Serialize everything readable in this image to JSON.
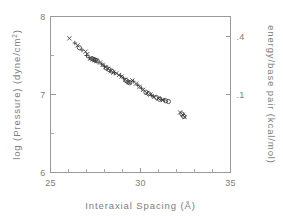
{
  "chart_data": {
    "type": "scatter",
    "title": "",
    "xlabel": "Interaxial Spacing",
    "xlabel_unit": "(Å)",
    "ylabel_left": "log (Pressure) (dyne/cm",
    "ylabel_left_sup": "2",
    "ylabel_left_close": ")",
    "ylabel_right": "energy/base pair (kcal/mol)",
    "xlim": [
      25,
      35
    ],
    "ylim": [
      6,
      8
    ],
    "xticks_major": [
      25,
      30,
      35
    ],
    "xticks_major_labels": [
      "25",
      "30",
      "35"
    ],
    "xticks_minor": [
      26,
      27,
      28,
      29,
      31,
      32,
      33,
      34
    ],
    "yticks_major": [
      6,
      7,
      8
    ],
    "yticks_major_labels": [
      "6",
      "7",
      "8"
    ],
    "yticks_minor": [
      6.5,
      7.5
    ],
    "right_axis_ticks": [
      7.75,
      7.0
    ],
    "right_axis_tick_labels": [
      ".4",
      ".1"
    ],
    "grid": false,
    "legend": "none",
    "axis_color": "#9a9a9a",
    "marker_color": "#3d3d3d",
    "background_color": "#ffffff",
    "series": [
      {
        "name": "cross",
        "marker": "x",
        "points": [
          [
            26.05,
            7.72
          ],
          [
            26.5,
            7.63
          ],
          [
            26.95,
            7.55
          ],
          [
            27.05,
            7.52
          ],
          [
            27.2,
            7.46
          ],
          [
            27.35,
            7.45
          ],
          [
            27.45,
            7.44
          ],
          [
            27.55,
            7.43
          ],
          [
            27.75,
            7.41
          ],
          [
            27.9,
            7.38
          ],
          [
            28.05,
            7.35
          ],
          [
            28.2,
            7.33
          ],
          [
            28.35,
            7.3
          ],
          [
            28.5,
            7.28
          ],
          [
            28.65,
            7.27
          ],
          [
            28.8,
            7.25
          ],
          [
            28.95,
            7.23
          ],
          [
            29.15,
            7.19
          ],
          [
            29.35,
            7.16
          ],
          [
            29.55,
            7.18
          ],
          [
            29.75,
            7.14
          ],
          [
            29.95,
            7.1
          ],
          [
            30.15,
            7.06
          ],
          [
            30.35,
            7.02
          ],
          [
            30.55,
            7.0
          ],
          [
            30.75,
            6.97
          ],
          [
            31.0,
            6.95
          ],
          [
            31.25,
            6.93
          ],
          [
            32.2,
            6.77
          ],
          [
            32.35,
            6.74
          ],
          [
            32.45,
            6.71
          ]
        ]
      },
      {
        "name": "open-circle",
        "marker": "o",
        "points": [
          [
            26.6,
            7.6
          ],
          [
            27.3,
            7.46
          ],
          [
            27.4,
            7.45
          ],
          [
            27.5,
            7.44
          ],
          [
            27.6,
            7.43
          ],
          [
            28.1,
            7.34
          ],
          [
            28.25,
            7.32
          ],
          [
            28.4,
            7.3
          ],
          [
            29.2,
            7.18
          ],
          [
            29.3,
            7.16
          ],
          [
            29.4,
            7.15
          ],
          [
            30.3,
            7.03
          ],
          [
            30.45,
            7.01
          ],
          [
            30.9,
            6.96
          ],
          [
            31.05,
            6.94
          ],
          [
            31.4,
            6.92
          ],
          [
            31.55,
            6.91
          ],
          [
            32.3,
            6.75
          ],
          [
            32.4,
            6.72
          ]
        ]
      },
      {
        "name": "plus",
        "marker": "+",
        "points": [
          [
            26.35,
            7.66
          ],
          [
            26.75,
            7.57
          ],
          [
            27.0,
            7.5
          ],
          [
            27.15,
            7.47
          ],
          [
            27.85,
            7.39
          ],
          [
            28.0,
            7.36
          ],
          [
            28.55,
            7.28
          ],
          [
            28.9,
            7.24
          ],
          [
            29.05,
            7.21
          ],
          [
            29.6,
            7.17
          ],
          [
            29.85,
            7.12
          ],
          [
            30.05,
            7.08
          ],
          [
            30.6,
            6.99
          ],
          [
            30.7,
            6.98
          ],
          [
            31.15,
            6.94
          ],
          [
            31.3,
            6.93
          ]
        ]
      }
    ]
  }
}
